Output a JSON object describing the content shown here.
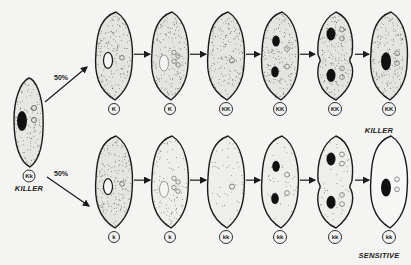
{
  "colors": {
    "ink": "#1a1a1a",
    "background": "#f4f4f2",
    "cell_fill": "#e6e6e3",
    "stipple": "#3a3a3a"
  },
  "parent": {
    "genotype": "Kk",
    "phenotype": "KILLER"
  },
  "branches": [
    {
      "name": "top",
      "percent": "50%"
    },
    {
      "name": "bottom",
      "percent": "50%"
    }
  ],
  "rows": [
    {
      "name": "top-row",
      "outcome": "KILLER",
      "cells": [
        {
          "genotype": "K",
          "stage": "micronucleus-ring",
          "stipple": "dense"
        },
        {
          "genotype": "K",
          "stage": "meiotic-products",
          "stipple": "dense"
        },
        {
          "genotype": "KK",
          "stage": "synkaryon",
          "stipple": "dense"
        },
        {
          "genotype": "KK",
          "stage": "two-macronuclear-anlagen",
          "stipple": "dense"
        },
        {
          "genotype": "KK",
          "stage": "fission",
          "stipple": "dense"
        },
        {
          "genotype": "KK",
          "stage": "exconjugant",
          "stipple": "dense"
        }
      ]
    },
    {
      "name": "bottom-row",
      "outcome": "SENSITIVE",
      "cells": [
        {
          "genotype": "k",
          "stage": "micronucleus-ring",
          "stipple": "dense"
        },
        {
          "genotype": "k",
          "stage": "meiotic-products",
          "stipple": "medium"
        },
        {
          "genotype": "kk",
          "stage": "synkaryon",
          "stipple": "sparse"
        },
        {
          "genotype": "kk",
          "stage": "two-macronuclear-anlagen",
          "stipple": "sparse"
        },
        {
          "genotype": "kk",
          "stage": "fission",
          "stipple": "sparse"
        },
        {
          "genotype": "kk",
          "stage": "exconjugant",
          "stipple": "none"
        }
      ]
    }
  ]
}
